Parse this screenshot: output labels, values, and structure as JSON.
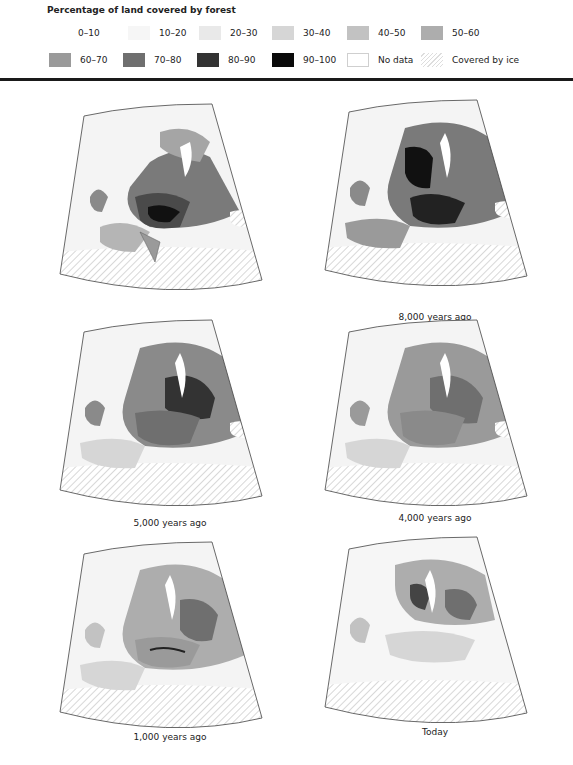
{
  "legend": {
    "title": "Percentage of land covered by forest",
    "items": [
      {
        "label": "0–10",
        "color": "#ffffff"
      },
      {
        "label": "10–20",
        "color": "#f6f6f6"
      },
      {
        "label": "20–30",
        "color": "#e9e9e9"
      },
      {
        "label": "30–40",
        "color": "#d6d6d6"
      },
      {
        "label": "40–50",
        "color": "#c2c2c2"
      },
      {
        "label": "50–60",
        "color": "#adadad"
      },
      {
        "label": "60–70",
        "color": "#9a9a9a"
      },
      {
        "label": "70–80",
        "color": "#6f6f6f"
      },
      {
        "label": "80–90",
        "color": "#333333"
      },
      {
        "label": "90–100",
        "color": "#0a0a0a"
      },
      {
        "label": "No data",
        "color": "#ffffff"
      },
      {
        "label": "Covered by ice",
        "color": "hatched"
      }
    ]
  },
  "maps": [
    {
      "caption": "9,000 years ago"
    },
    {
      "caption": "8,000 years ago"
    },
    {
      "caption": "5,000 years ago"
    },
    {
      "caption": "4,000 years ago"
    },
    {
      "caption": "1,000 years ago"
    },
    {
      "caption": "Today"
    }
  ]
}
